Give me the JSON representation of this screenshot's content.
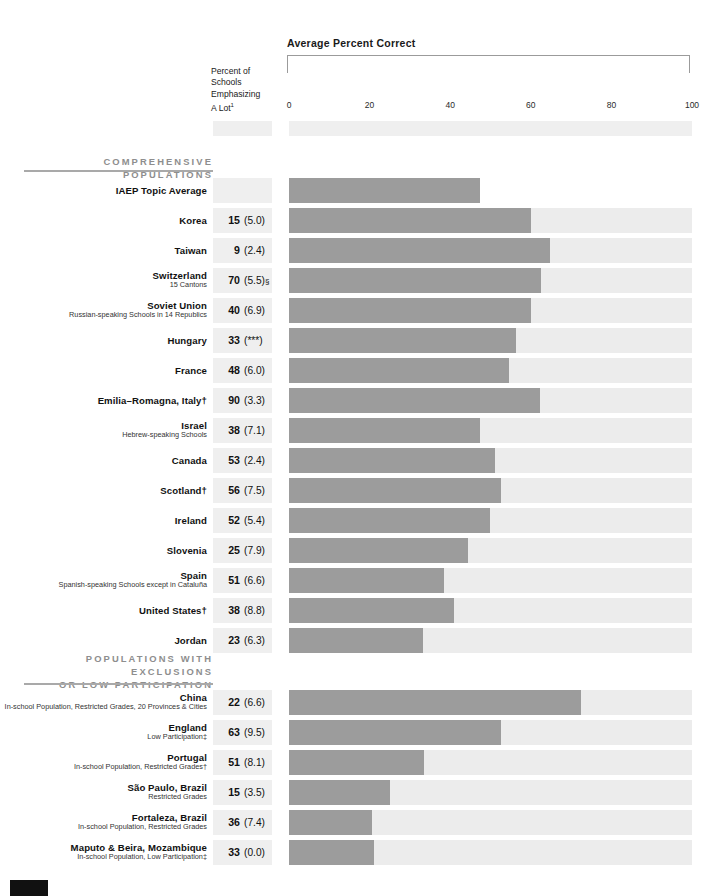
{
  "header": {
    "chart_title": "Average Percent Correct",
    "column_head_lines": [
      "Percent of",
      "Schools",
      "Emphasizing",
      "A Lot"
    ],
    "column_head_superscript": "1"
  },
  "axis": {
    "ticks": [
      "0",
      "20",
      "40",
      "60",
      "80",
      "100"
    ],
    "min": 0,
    "max": 100
  },
  "sections": [
    {
      "title_lines": [
        "COMPREHENSIVE POPULATIONS"
      ]
    },
    {
      "title_lines": [
        "POPULATIONS WITH EXCLUSIONS",
        "OR LOW PARTICIPATION"
      ]
    }
  ],
  "colors": {
    "bar": "#9c9c9c",
    "track": "#ececec",
    "number_band": "#efefef",
    "section_label": "#8e8e8e",
    "rule": "#a9a9a9"
  },
  "chart_data": {
    "type": "bar",
    "title": "Average Percent Correct",
    "xlabel": "Average Percent Correct",
    "ylabel": "",
    "xlim": [
      0,
      100
    ],
    "grid": false,
    "legend": "none",
    "orientation": "horizontal",
    "value_column_header": "Percent of Schools Emphasizing A Lot",
    "groups": [
      {
        "name": "COMPREHENSIVE POPULATIONS",
        "rows": [
          {
            "label": "IAEP Topic Average",
            "sub": "",
            "percent": "",
            "se": "",
            "marker": "",
            "value": 47.5
          },
          {
            "label": "Korea",
            "sub": "",
            "percent": "15",
            "se": "(5.0)",
            "marker": "",
            "value": 60.0
          },
          {
            "label": "Taiwan",
            "sub": "",
            "percent": "9",
            "se": "(2.4)",
            "marker": "",
            "value": 64.7
          },
          {
            "label": "Switzerland",
            "sub": "15 Cantons",
            "percent": "70",
            "se": "(5.5)",
            "marker": "§",
            "value": 62.5
          },
          {
            "label": "Soviet Union",
            "sub": "Russian-speaking Schools in 14 Republics",
            "percent": "40",
            "se": "(6.9)",
            "marker": "",
            "value": 60.0
          },
          {
            "label": "Hungary",
            "sub": "",
            "percent": "33",
            "se": "(***)",
            "marker": "",
            "value": 56.3
          },
          {
            "label": "France",
            "sub": "",
            "percent": "48",
            "se": "(6.0)",
            "marker": "",
            "value": 54.5
          },
          {
            "label": "Emilia–Romagna, Italy†",
            "sub": "",
            "percent": "90",
            "se": "(3.3)",
            "marker": "",
            "value": 62.3
          },
          {
            "label": "Israel",
            "sub": "Hebrew-speaking Schools",
            "percent": "38",
            "se": "(7.1)",
            "marker": "",
            "value": 47.3
          },
          {
            "label": "Canada",
            "sub": "",
            "percent": "53",
            "se": "(2.4)",
            "marker": "",
            "value": 51.0
          },
          {
            "label": "Scotland†",
            "sub": "",
            "percent": "56",
            "se": "(7.5)",
            "marker": "",
            "value": 52.5
          },
          {
            "label": "Ireland",
            "sub": "",
            "percent": "52",
            "se": "(5.4)",
            "marker": "",
            "value": 49.8
          },
          {
            "label": "Slovenia",
            "sub": "",
            "percent": "25",
            "se": "(7.9)",
            "marker": "",
            "value": 44.3
          },
          {
            "label": "Spain",
            "sub": "Spanish-speaking Schools except in Cataluña",
            "percent": "51",
            "se": "(6.6)",
            "marker": "",
            "value": 38.5
          },
          {
            "label": "United States†",
            "sub": "",
            "percent": "38",
            "se": "(8.8)",
            "marker": "",
            "value": 41.0
          },
          {
            "label": "Jordan",
            "sub": "",
            "percent": "23",
            "se": "(6.3)",
            "marker": "",
            "value": 33.3
          }
        ]
      },
      {
        "name": "POPULATIONS WITH EXCLUSIONS OR LOW PARTICIPATION",
        "rows": [
          {
            "label": "China",
            "sub": "In-school Population, Restricted Grades, 20 Provinces & Cities",
            "percent": "22",
            "se": "(6.6)",
            "marker": "",
            "value": 72.5
          },
          {
            "label": "England",
            "sub": "Low Participation‡",
            "percent": "63",
            "se": "(9.5)",
            "marker": "",
            "value": 52.5
          },
          {
            "label": "Portugal",
            "sub": "In-school Population, Restricted Grades†",
            "percent": "51",
            "se": "(8.1)",
            "marker": "",
            "value": 33.5
          },
          {
            "label": "São Paulo, Brazil",
            "sub": "Restricted Grades",
            "percent": "15",
            "se": "(3.5)",
            "marker": "",
            "value": 25.0
          },
          {
            "label": "Fortaleza, Brazil",
            "sub": "In-school Population, Restricted Grades",
            "percent": "36",
            "se": "(7.4)",
            "marker": "",
            "value": 20.7
          },
          {
            "label": "Maputo & Beira, Mozambique",
            "sub": "In-school Population, Low Participation‡",
            "percent": "33",
            "se": "(0.0)",
            "marker": "",
            "value": 21.2
          }
        ]
      }
    ]
  }
}
